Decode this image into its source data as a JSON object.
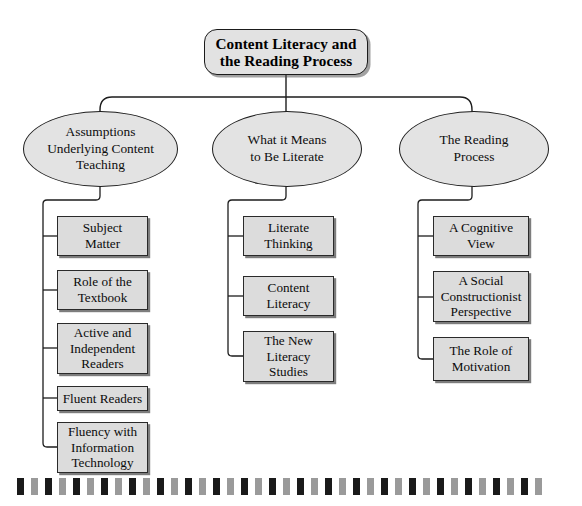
{
  "diagram": {
    "title": "Content Literacy and the Reading Process",
    "type": "hierarchy-tree",
    "colors": {
      "page_background": "#ffffff",
      "node_fill": "#e0e0e0",
      "node_border": "#1d1d1d",
      "shadow": "#7d7d7d",
      "text": "#0b0b0b",
      "bar_dark": "#1a1a1a",
      "bar_light": "#9a9a9a"
    },
    "root": {
      "label": "Content Literacy and the Reading Process",
      "lines": [
        "Content Literacy and",
        "the Reading Process"
      ],
      "shape": "rounded-rectangle"
    },
    "branches": [
      {
        "label": "Assumptions Underlying Content Teaching",
        "lines": [
          "Assumptions",
          "Underlying Content",
          "Teaching"
        ],
        "shape": "ellipse",
        "children": [
          {
            "label": "Subject Matter",
            "lines": [
              "Subject",
              "Matter"
            ]
          },
          {
            "label": "Role of the Textbook",
            "lines": [
              "Role of the",
              "Textbook"
            ]
          },
          {
            "label": "Active and Independent Readers",
            "lines": [
              "Active and",
              "Independent",
              "Readers"
            ]
          },
          {
            "label": "Fluent Readers",
            "lines": [
              "Fluent Readers"
            ]
          },
          {
            "label": "Fluency with Information Technology",
            "lines": [
              "Fluency with",
              "Information",
              "Technology"
            ]
          }
        ]
      },
      {
        "label": "What it Means to Be Literate",
        "lines": [
          "What it Means",
          "to Be Literate"
        ],
        "shape": "ellipse",
        "children": [
          {
            "label": "Literate Thinking",
            "lines": [
              "Literate",
              "Thinking"
            ]
          },
          {
            "label": "Content Literacy",
            "lines": [
              "Content",
              "Literacy"
            ]
          },
          {
            "label": "The New Literacy Studies",
            "lines": [
              "The New",
              "Literacy",
              "Studies"
            ]
          }
        ]
      },
      {
        "label": "The Reading Process",
        "lines": [
          "The Reading",
          "Process"
        ],
        "shape": "ellipse",
        "children": [
          {
            "label": "A Cognitive View",
            "lines": [
              "A Cognitive",
              "View"
            ]
          },
          {
            "label": "A Social Constructionist Perspective",
            "lines": [
              "A Social",
              "Constructionist",
              "Perspective"
            ]
          },
          {
            "label": "The Role of Motivation",
            "lines": [
              "The Role of",
              "Motivation"
            ]
          }
        ]
      }
    ],
    "decorative_bar": {
      "name": "barcode-strip",
      "block_count": 38,
      "pattern": [
        "dark",
        "light"
      ],
      "block_width": 7,
      "block_height": 17,
      "gap": 7,
      "left": 17,
      "top": 478
    }
  }
}
